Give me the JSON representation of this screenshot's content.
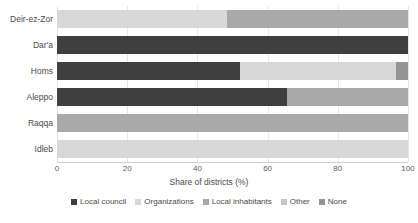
{
  "chart_data": {
    "type": "bar",
    "orientation": "horizontal",
    "stacked": true,
    "normalized": true,
    "title": "",
    "xlabel": "Share of districts (%)",
    "ylabel": "",
    "xlim": [
      0,
      100
    ],
    "xticks": [
      0,
      20,
      40,
      60,
      80,
      100
    ],
    "xtick_labels": [
      "0",
      "20",
      "40",
      "60",
      "80",
      "100"
    ],
    "grid": true,
    "legend_position": "bottom",
    "categories": [
      "Deir-ez-Zor",
      "Dar'a",
      "Homs",
      "Aleppo",
      "Raqqa",
      "Idleb"
    ],
    "series": [
      {
        "name": "Local council",
        "color": "#3f3f3f",
        "values": [
          0,
          100,
          52,
          65.5,
          0,
          0
        ]
      },
      {
        "name": "Organizations",
        "color": "#d8d8d8",
        "values": [
          48.5,
          0,
          44.5,
          0,
          0,
          100
        ]
      },
      {
        "name": "Local inhabitants",
        "color": "#a9a9a9",
        "values": [
          51.5,
          0,
          0,
          34.5,
          100,
          0
        ]
      },
      {
        "name": "Other",
        "color": "#c6c6c6",
        "values": [
          0,
          0,
          0,
          0,
          0,
          0
        ]
      },
      {
        "name": "None",
        "color": "#949494",
        "values": [
          0,
          0,
          3.5,
          0,
          0,
          0
        ]
      }
    ]
  },
  "axis": {
    "x_title": "Share of districts (%)"
  },
  "legend": {
    "items": [
      {
        "label": "Local council",
        "color": "#3f3f3f",
        "swatch": "legend-swatch-icon"
      },
      {
        "label": "Organizations",
        "color": "#d8d8d8",
        "swatch": "legend-swatch-icon"
      },
      {
        "label": "Local inhabitants",
        "color": "#a9a9a9",
        "swatch": "legend-swatch-icon"
      },
      {
        "label": "Other",
        "color": "#c6c6c6",
        "swatch": "legend-swatch-icon"
      },
      {
        "label": "None",
        "color": "#949494",
        "swatch": "legend-swatch-icon"
      }
    ]
  }
}
